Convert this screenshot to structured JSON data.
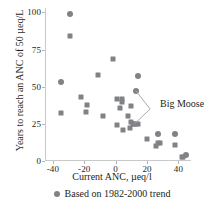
{
  "chart_data": {
    "type": "scatter",
    "title": "",
    "xlabel": "Current ANC, µeq/l",
    "ylabel": "Years to reach an ANC of 50 µeq/L",
    "xlim": [
      -45,
      48
    ],
    "ylim": [
      0,
      103
    ],
    "xticks": [
      -40,
      -20,
      0,
      20,
      40
    ],
    "yticks": [
      0,
      25,
      50,
      75,
      100
    ],
    "grid": false,
    "legend_position": "below-axis",
    "marker_color": "#808285",
    "axis_color": "#c9c9c9",
    "text_color": "#231f20",
    "legend": [
      {
        "label": "Based on 1982-2000 trend",
        "marker": "circle",
        "color": "#808285"
      }
    ],
    "annotations": [
      {
        "text": "Big Moose",
        "points": [
          [
            13,
            47
          ],
          [
            12,
            25
          ]
        ],
        "label_x": 22,
        "label_y": 35
      }
    ],
    "series": [
      {
        "name": "Based on 1982-2000 trend",
        "marker": "circle",
        "color": "#808285",
        "points": [
          [
            -29,
            99
          ],
          [
            -35,
            53
          ],
          [
            14,
            57
          ],
          [
            13,
            47
          ],
          [
            38,
            18
          ],
          [
            45,
            4
          ],
          [
            27,
            18
          ]
        ]
      },
      {
        "name": "Other sites",
        "marker": "square",
        "color": "#808285",
        "points": [
          [
            -29,
            84
          ],
          [
            -35,
            32
          ],
          [
            -2,
            69
          ],
          [
            -11,
            58
          ],
          [
            -22,
            43
          ],
          [
            -18,
            38
          ],
          [
            -19,
            33
          ],
          [
            -8,
            30
          ],
          [
            1,
            42
          ],
          [
            4,
            42
          ],
          [
            4,
            40
          ],
          [
            3,
            36
          ],
          [
            10,
            37
          ],
          [
            8,
            30
          ],
          [
            1,
            24
          ],
          [
            5,
            21
          ],
          [
            9,
            22
          ],
          [
            10,
            26
          ],
          [
            11,
            25
          ],
          [
            12,
            25
          ],
          [
            13,
            25
          ],
          [
            14,
            25
          ],
          [
            20,
            15
          ],
          [
            26,
            10
          ],
          [
            27,
            12
          ],
          [
            28,
            12
          ],
          [
            38,
            11
          ],
          [
            42,
            3
          ],
          [
            43,
            3
          ]
        ]
      }
    ]
  }
}
